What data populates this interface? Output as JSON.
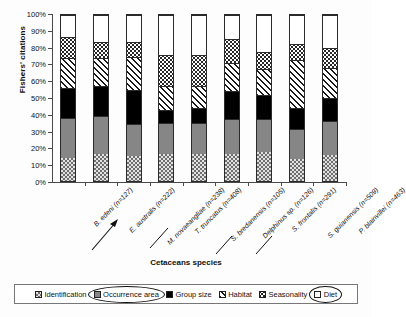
{
  "chart_data": {
    "type": "bar",
    "subtype": "stacked-100-percent",
    "title": "",
    "xlabel": "Cetaceans species",
    "ylabel": "Fishers' citations",
    "ylim": [
      0,
      100
    ],
    "yunit": "%",
    "ytick_labels": [
      "0%",
      "10%",
      "20%",
      "30%",
      "40%",
      "50%",
      "60%",
      "70%",
      "80%",
      "90%",
      "100%"
    ],
    "ytick_values": [
      0,
      10,
      20,
      30,
      40,
      50,
      60,
      70,
      80,
      90,
      100
    ],
    "grid": false,
    "legend_position": "bottom",
    "categories": [
      "B. edeni (n=127)",
      "E. australis (n=222)",
      "M. novaeangliae (n=238)",
      "T. truncatus (n=408)",
      "S. bredanensis (n=105)",
      "Delphinus sp. (n=126)",
      "S. frontalis (n=291)",
      "S. guianensis (n=509)",
      "P. blainvillei (n=463)"
    ],
    "series": [
      {
        "name": "Identification",
        "pattern": "checkered",
        "values": [
          14.0,
          16.5,
          15.0,
          16.0,
          16.0,
          16.0,
          17.5,
          13.0,
          15.5
        ]
      },
      {
        "name": "Occurrence area",
        "pattern": "solid-gray",
        "values": [
          24.0,
          22.5,
          19.5,
          19.0,
          19.0,
          21.5,
          20.0,
          18.5,
          20.5
        ]
      },
      {
        "name": "Group size",
        "pattern": "solid-black",
        "values": [
          18.0,
          18.0,
          20.5,
          8.0,
          9.0,
          16.5,
          14.5,
          12.5,
          14.0
        ]
      },
      {
        "name": "Habitat",
        "pattern": "diagonal-hatch",
        "values": [
          18.0,
          17.0,
          20.0,
          14.0,
          13.0,
          17.0,
          15.5,
          29.0,
          18.0
        ]
      },
      {
        "name": "Seasonality",
        "pattern": "dotted",
        "values": [
          13.0,
          10.0,
          9.0,
          19.0,
          19.0,
          14.5,
          10.5,
          9.5,
          12.0
        ]
      },
      {
        "name": "Diet",
        "pattern": "white",
        "values": [
          13.0,
          16.0,
          16.0,
          24.0,
          24.0,
          14.5,
          22.0,
          17.5,
          20.0
        ]
      }
    ],
    "annotations": [
      {
        "type": "ellipse",
        "target": "Occurrence area",
        "location": "legend"
      },
      {
        "type": "ellipse",
        "target": "Diet",
        "location": "legend"
      },
      {
        "type": "arrow",
        "target": "M. novaeangliae (n=238)",
        "location": "x-axis"
      }
    ]
  },
  "legend": {
    "items": [
      {
        "label": "Identification",
        "swatch": "checkered-swatch"
      },
      {
        "label": "Occurrence area",
        "swatch": "solid-gray-swatch"
      },
      {
        "label": "Group size",
        "swatch": "solid-black-swatch"
      },
      {
        "label": "Habitat",
        "swatch": "diagonal-hatch-swatch"
      },
      {
        "label": "Seasonality",
        "swatch": "dotted-swatch"
      },
      {
        "label": "Diet",
        "swatch": "white-swatch"
      }
    ]
  }
}
